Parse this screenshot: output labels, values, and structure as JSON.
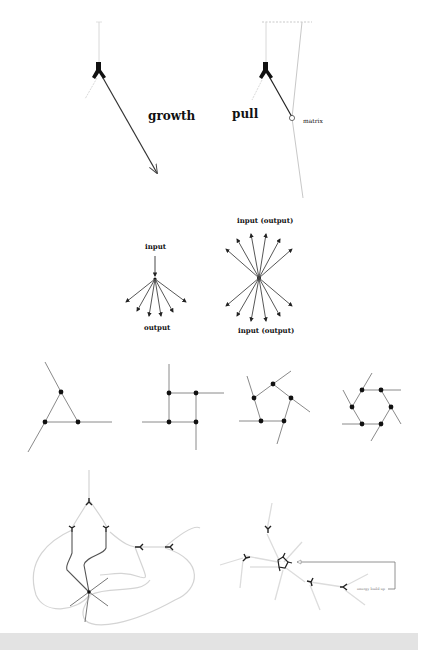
{
  "figure": {
    "panels": [
      {
        "id": "growth",
        "label": "growth",
        "description": "Y-shaped growth cone extending a long arrow downward-right"
      },
      {
        "id": "pull",
        "label": "pull",
        "secondary_label": "matrix",
        "description": "Y-shaped growth cone attached by a line to a matrix anchor point; a long thin matrix line runs vertically with dashed top boundary"
      },
      {
        "id": "convergent",
        "top_label": "input",
        "bottom_label": "output",
        "description": "Single input arrow fans out into 7 output arrows",
        "output_count": 7
      },
      {
        "id": "bidirectional",
        "top_label": "input (output)",
        "bottom_label": "input (output)",
        "description": "Central node with 6 arrows up and 6 arrows down",
        "arrows_up": 6,
        "arrows_down": 6
      },
      {
        "id": "polygons",
        "shapes": [
          {
            "name": "triangle",
            "nodes": 3
          },
          {
            "name": "square",
            "nodes": 4
          },
          {
            "name": "pentagon",
            "nodes": 5
          },
          {
            "name": "hexagon",
            "nodes": 6
          }
        ],
        "description": "Pinwheel polygon networks with nodes and outward tails"
      },
      {
        "id": "network-left",
        "description": "Branching network of growth cones converging on a 6-way node with looping grey paths"
      },
      {
        "id": "network-right",
        "annotation": "energy build up",
        "description": "Growth cones around a central knotted cluster with an arrow feedback loop labeled energy build up"
      }
    ]
  },
  "colors": {
    "ink": "#111111",
    "line_dark": "#333333",
    "line_grey": "#9a9a9a",
    "line_light": "#cfcfcf",
    "footer": "#e3e3e3",
    "background": "#ffffff"
  }
}
